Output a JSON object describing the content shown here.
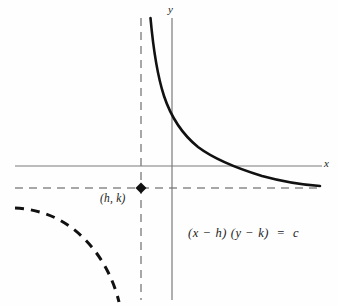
{
  "figure": {
    "background_color": "#fefefe",
    "width": 339,
    "height": 306
  },
  "axes": {
    "x_label": "x",
    "y_label": "y",
    "axis_color": "#7a7a7a",
    "x_axis": {
      "y_pixel": 166,
      "x_start": 15,
      "x_end": 322
    },
    "y_axis": {
      "x_pixel": 172,
      "y_start": 18,
      "y_end": 300
    }
  },
  "asymptotes": {
    "color": "#8a8a8a",
    "style": "dashed",
    "vertical": {
      "x_pixel": 141,
      "y_start": 18,
      "y_end": 300,
      "equation": "x = h"
    },
    "horizontal": {
      "y_pixel": 188,
      "x_start": 15,
      "x_end": 320,
      "equation": "y = k"
    }
  },
  "center_point": {
    "label": "(h, k)",
    "marker": "filled-diamond",
    "color": "#111111",
    "x_pixel": 141,
    "y_pixel": 188
  },
  "curves": {
    "primary_branch": {
      "name": "upper-right-branch",
      "style": "solid",
      "color": "#111111",
      "stroke_width": 2.6,
      "path": "M 150.5 18 C 153.2 48, 157.5 76, 164 96 C 171 117, 182 134, 198 147 C 214 159, 236 168, 262 176 C 284 182, 304 185, 320 186"
    },
    "secondary_branch": {
      "name": "lower-left-branch",
      "style": "dashed",
      "color": "#111111",
      "stroke_width": 3.0,
      "dash_pattern": "9 7",
      "path": "M 15 208 C 35 209, 55 215, 72 228 C 88 240, 100 256, 108 272 C 114 284, 117 294, 119 302"
    }
  },
  "equation": {
    "text": "(x − h) (y − k)  =  c",
    "plain": "(x - h)(y - k) = c"
  },
  "colors": {
    "ink": "#111111",
    "axis_gray": "#7a7a7a",
    "dash_gray": "#8a8a8a",
    "paper": "#fefefe"
  }
}
